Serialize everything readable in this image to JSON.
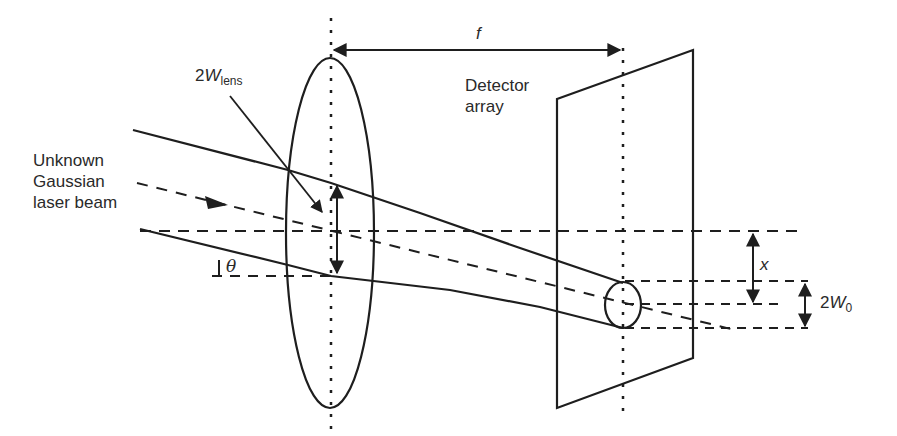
{
  "diagram": {
    "colors": {
      "stroke": "#1e1e1e",
      "background": "#ffffff",
      "text": "#2a2a2a"
    },
    "labels": {
      "beam_line1": "Unknown",
      "beam_line2": "Gaussian",
      "beam_line3": "laser beam",
      "lens_width_prefix": "2",
      "lens_width_symbol": "W",
      "lens_width_sub": "lens",
      "focal_length": "f",
      "detector_line1": "Detector",
      "detector_line2": "array",
      "angle": "θ",
      "offset": "x",
      "waist_prefix": "2",
      "waist_symbol": "W",
      "waist_sub": "0"
    },
    "elements": [
      "lens (ellipse)",
      "lens optical axis (dotted vertical)",
      "detector array (parallelogram)",
      "detector plane axis (dotted vertical)",
      "focal length arrow f",
      "incoming beam envelope (two solid lines)",
      "beam center ray (dashed, with arrowhead)",
      "reference axis (dashed horizontal)",
      "focused spot (small ellipse)",
      "offset arrow x",
      "waist arrow 2W0",
      "lens width arrow 2W_lens",
      "tilt angle theta"
    ]
  }
}
